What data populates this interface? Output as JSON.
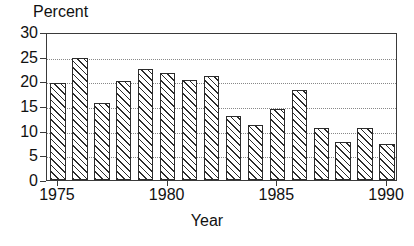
{
  "chart_data": {
    "type": "bar",
    "title": "",
    "subtitle": "",
    "xlabel": "Year",
    "ylabel": "Percent",
    "categories": [
      1975,
      1976,
      1977,
      1978,
      1979,
      1980,
      1981,
      1982,
      1983,
      1984,
      1985,
      1986,
      1987,
      1988,
      1989,
      1990
    ],
    "values": [
      19.7,
      24.8,
      15.7,
      20.1,
      22.5,
      21.7,
      20.2,
      21.1,
      13.0,
      11.2,
      14.3,
      18.2,
      10.5,
      7.8,
      10.5,
      7.2
    ],
    "series": [
      {
        "name": "Percent",
        "values": [
          19.7,
          24.8,
          15.7,
          20.1,
          22.5,
          21.7,
          20.2,
          21.1,
          13.0,
          11.2,
          14.3,
          18.2,
          10.5,
          7.8,
          10.5,
          7.2
        ]
      }
    ],
    "ylim": [
      0,
      30
    ],
    "xlim": [
      1974.5,
      1990.5
    ],
    "yticks": [
      0,
      5,
      10,
      15,
      20,
      25,
      30
    ],
    "ytick_labels": [
      "0",
      "5",
      "10",
      "15",
      "20",
      "25",
      "30"
    ],
    "xticks": [
      1975,
      1980,
      1985,
      1990
    ],
    "xtick_labels": [
      "1975",
      "1980",
      "1985",
      "1990"
    ],
    "grid": "horizontal-dotted",
    "legend": "none",
    "bar_fill": "diagonal-hatch",
    "colors": {
      "axis": "#3a3a3a",
      "bar_edge": "#2b2b2b",
      "bar_hatch": "#2b2b2b",
      "bar_face": "#ffffff",
      "gridline": "#888888",
      "text": "#111111",
      "background": "#ffffff"
    }
  }
}
